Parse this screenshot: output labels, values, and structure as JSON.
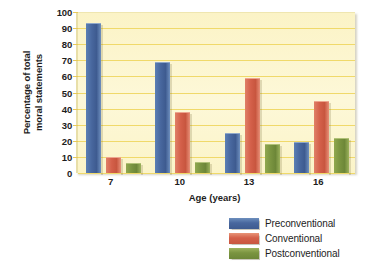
{
  "chart_data": {
    "type": "bar",
    "title": "",
    "xlabel": "Age (years)",
    "ylabel_line1": "Percentage of total",
    "ylabel_line2": "moral statements",
    "categories": [
      "7",
      "10",
      "13",
      "16"
    ],
    "ytick_labels": [
      "0",
      "10",
      "20",
      "30",
      "40",
      "50",
      "60",
      "70",
      "80",
      "90",
      "100"
    ],
    "ylim": [
      0,
      100
    ],
    "grid": true,
    "legend_position": "bottom-right",
    "series": [
      {
        "name": "Preconventional",
        "color": "#48679e",
        "values": [
          93,
          69,
          25,
          19
        ]
      },
      {
        "name": "Conventional",
        "color": "#d4604a",
        "values": [
          10,
          38,
          59,
          45
        ]
      },
      {
        "name": "Postconventional",
        "color": "#7a9440",
        "values": [
          6,
          7,
          18,
          22
        ]
      }
    ]
  },
  "plot": {
    "background_color": "#fcf5cd",
    "gridline_color": "#f0d96a"
  }
}
